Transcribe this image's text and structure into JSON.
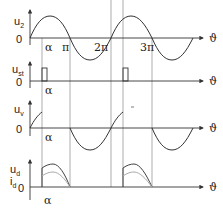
{
  "diagram": {
    "panels": [
      {
        "name": "u2",
        "label_main": "u",
        "label_sub": "2",
        "zero": "0"
      },
      {
        "name": "ust",
        "label_main": "u",
        "label_sub": "st",
        "zero": "0"
      },
      {
        "name": "uv",
        "label_main": "u",
        "label_sub": "v",
        "zero": "0"
      },
      {
        "name": "ud",
        "label_main": "u",
        "label_sub": "d",
        "label2_main": "i",
        "label2_sub": "d",
        "zero": "0"
      }
    ],
    "x_axis_symbol": "ϑ",
    "tick_labels": {
      "alpha": "α",
      "pi": "π",
      "two_pi": "2π",
      "three_pi": "3π"
    },
    "colors": {
      "curve": "#444444",
      "axis": "#555555",
      "gridline": "#888888",
      "current": "#aaaaaa"
    }
  }
}
